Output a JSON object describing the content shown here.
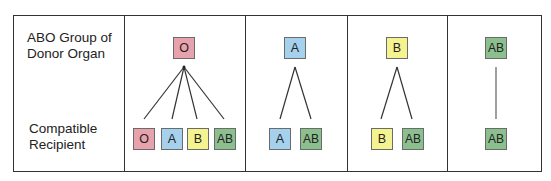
{
  "row_labels": {
    "donor": [
      "ABO Group of",
      "Donor Organ"
    ],
    "recipient": [
      "Compatible",
      "Recipient"
    ]
  },
  "colors": {
    "O": "#e8a2ad",
    "A": "#a6d1ec",
    "B": "#f5f290",
    "AB": "#8cbf8e",
    "border": "#333333"
  },
  "columns": [
    {
      "donor": "O",
      "recipients": [
        "O",
        "A",
        "B",
        "AB"
      ]
    },
    {
      "donor": "A",
      "recipients": [
        "A",
        "AB"
      ]
    },
    {
      "donor": "B",
      "recipients": [
        "B",
        "AB"
      ]
    },
    {
      "donor": "AB",
      "recipients": [
        "AB"
      ]
    }
  ]
}
